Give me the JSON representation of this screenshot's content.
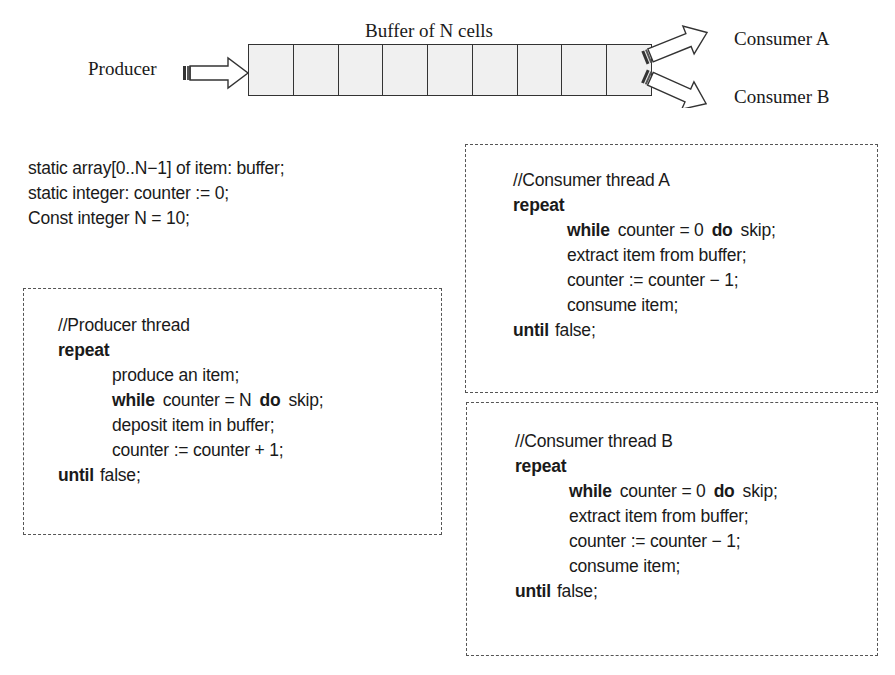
{
  "diagram": {
    "buffer_title": "Buffer of N cells",
    "buffer_cell_count": 9,
    "producer_label": "Producer",
    "consumer_a_label": "Consumer A",
    "consumer_b_label": "Consumer B",
    "icons": {
      "producer_arrow": "right-arrow-icon",
      "consumer_a_arrow": "up-right-arrow-icon",
      "consumer_b_arrow": "down-right-arrow-icon"
    }
  },
  "declarations": [
    "static array[0..N−1] of item: buffer;",
    "static integer: counter := 0;",
    "Const integer N = 10;"
  ],
  "producer": {
    "comment": "//Producer thread",
    "repeat_kw": "repeat",
    "produce": "produce an item;",
    "while_kw": "while",
    "while_cond": "counter = N",
    "do_kw": "do",
    "skip": "skip;",
    "deposit": "deposit item in buffer;",
    "increment": "counter := counter + 1;",
    "until_kw": "until",
    "until_cond": "false;"
  },
  "consumer_a": {
    "comment": "//Consumer thread A",
    "repeat_kw": "repeat",
    "while_kw": "while",
    "while_cond": "counter = 0",
    "do_kw": "do",
    "skip": "skip;",
    "extract": "extract item from buffer;",
    "decrement": "counter := counter − 1;",
    "consume": "consume item;",
    "until_kw": "until",
    "until_cond": "false;"
  },
  "consumer_b": {
    "comment": "//Consumer thread B",
    "repeat_kw": "repeat",
    "while_kw": "while",
    "while_cond": "counter = 0",
    "do_kw": "do",
    "skip": "skip;",
    "extract": "extract item from buffer;",
    "decrement": "counter := counter − 1;",
    "consume": "consume item;",
    "until_kw": "until",
    "until_cond": "false;"
  }
}
